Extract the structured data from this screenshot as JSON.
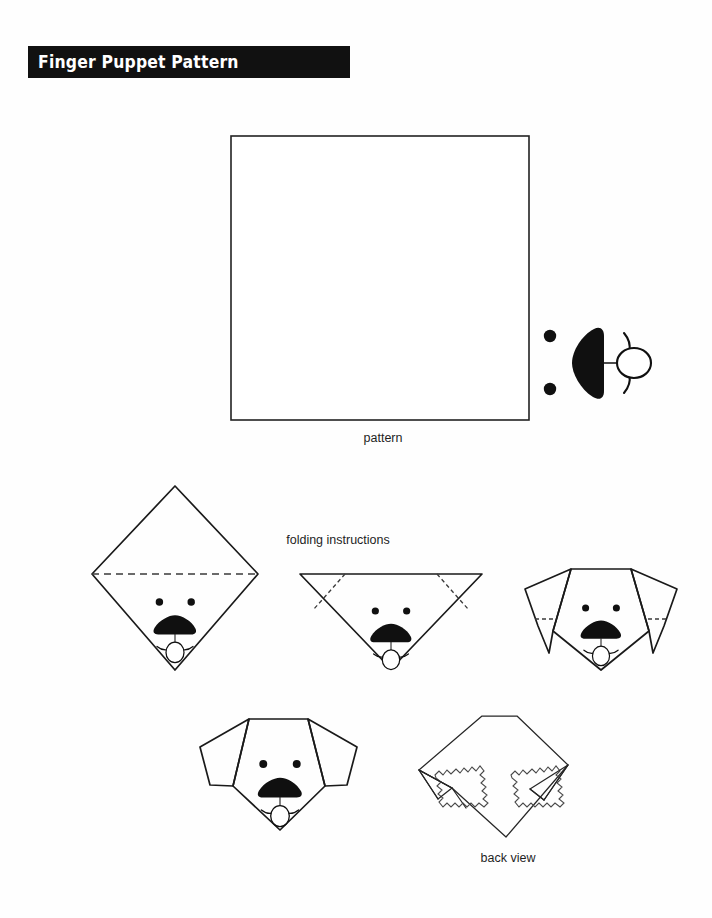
{
  "document": {
    "title": "Finger Puppet Pattern",
    "background_color": "#ffffff",
    "ink_color": "#101010",
    "banner_color": "#111111",
    "banner_text_color": "#ffffff"
  },
  "captions": {
    "pattern": "pattern",
    "folding": "folding instructions",
    "back_view": "back view"
  },
  "figures": {
    "pattern_square": {
      "label": "pattern",
      "shape": "square",
      "contents": "dog face rotated 90 degrees in lower-right corner"
    },
    "step1": {
      "label": "fold square in half diagonally",
      "shape": "diamond",
      "fold_lines": "one horizontal dashed fold line"
    },
    "step2": {
      "label": "fold ears down",
      "shape": "downward triangle",
      "fold_lines": "two diagonal dashed fold lines"
    },
    "step3": {
      "label": "ears folded down",
      "shape": "dog head with pointed ears",
      "fold_lines": "two short dashed ear-tip fold lines"
    },
    "step4": {
      "label": "finished finger puppet front",
      "shape": "dog head with rounded ears"
    },
    "back_view": {
      "label": "back view",
      "shape": "folded paper with two finger pockets",
      "pockets": 2
    }
  },
  "dog_face": {
    "eyes": 2,
    "nose": "black triangle",
    "mouth": "two curves",
    "tongue": "oval"
  }
}
